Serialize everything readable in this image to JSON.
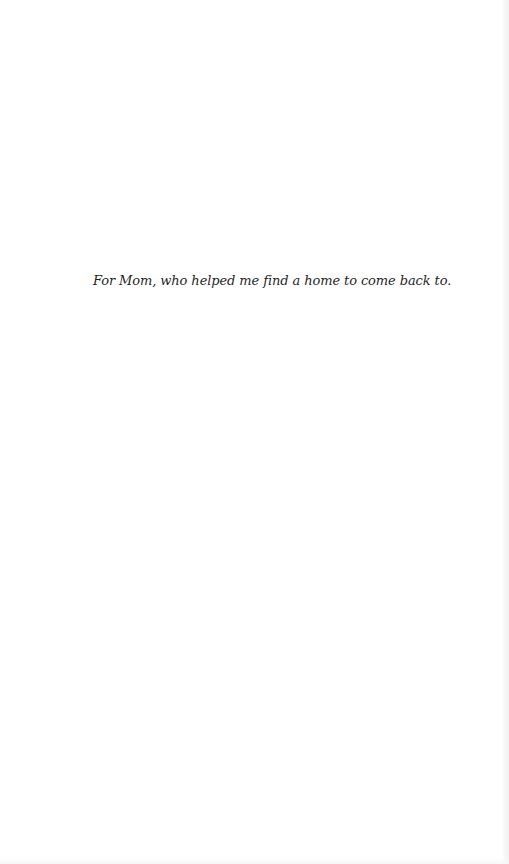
{
  "page": {
    "type": "dedication",
    "dedication_text": "For Mom, who helped me find a home to come back to."
  },
  "colors": {
    "background": "#ffffff",
    "text": "#1f1f1f"
  }
}
